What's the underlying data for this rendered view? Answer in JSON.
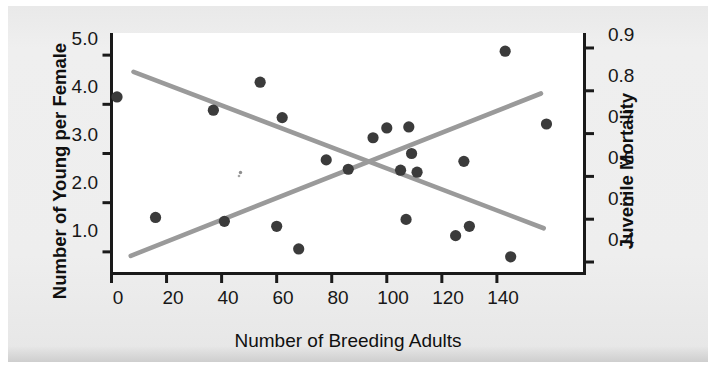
{
  "chart_data": {
    "type": "scatter",
    "title": "",
    "xlabel": "Number of Breeding Adults",
    "ylabel": "Number of Young per Female",
    "y2label": "Juvenile Mortality",
    "xlim": [
      0,
      172
    ],
    "ylim": [
      0.55,
      5.45
    ],
    "y2lim": [
      0.372,
      0.935
    ],
    "grid": false,
    "legend": null,
    "xticks": [
      "0",
      "20",
      "40",
      "60",
      "80",
      "100",
      "120",
      "140"
    ],
    "xtick_values": [
      0,
      20,
      40,
      60,
      80,
      100,
      120,
      140
    ],
    "yticks": [
      "1.0",
      "2.0",
      "3.0",
      "4.0",
      "5.0"
    ],
    "ytick_values": [
      1.0,
      2.0,
      3.0,
      4.0,
      5.0
    ],
    "y2ticks": [
      "0.4",
      "0.5",
      "0.6",
      "0.7",
      "0.8",
      "0.9"
    ],
    "y2tick_values": [
      0.4,
      0.5,
      0.6,
      0.7,
      0.8,
      0.9
    ],
    "marker_color": "#3b3b3b",
    "line_color": "#9a9a9a",
    "axis_color": "#1a1a1a",
    "plot_bg": "#ffffff",
    "page_bg": "#eeeeee",
    "series": [
      {
        "name": "Number of Young per Female",
        "axis": "left",
        "marker": "filled-circle",
        "points": [
          {
            "x": 2,
            "y": 4.15
          },
          {
            "x": 16,
            "y": 1.7
          },
          {
            "x": 37,
            "y": 3.88
          },
          {
            "x": 41,
            "y": 1.62
          },
          {
            "x": 54,
            "y": 4.45
          },
          {
            "x": 60,
            "y": 1.52
          },
          {
            "x": 62,
            "y": 3.73
          },
          {
            "x": 68,
            "y": 1.06
          },
          {
            "x": 78,
            "y": 2.87
          },
          {
            "x": 86,
            "y": 2.68
          },
          {
            "x": 95,
            "y": 3.32
          },
          {
            "x": 100,
            "y": 3.52
          },
          {
            "x": 105,
            "y": 2.66
          },
          {
            "x": 107,
            "y": 1.66
          },
          {
            "x": 108,
            "y": 3.54
          },
          {
            "x": 109,
            "y": 3.0
          },
          {
            "x": 111,
            "y": 2.62
          },
          {
            "x": 125,
            "y": 1.33
          },
          {
            "x": 128,
            "y": 2.84
          },
          {
            "x": 130,
            "y": 1.52
          },
          {
            "x": 143,
            "y": 5.08
          },
          {
            "x": 145,
            "y": 0.9
          },
          {
            "x": 158,
            "y": 3.6
          }
        ]
      }
    ],
    "trendlines": [
      {
        "name": "declining-trend-young-per-female",
        "axis": "left",
        "x1": 8,
        "y1": 4.66,
        "x2": 157,
        "y2": 1.48,
        "color": "#9a9a9a"
      },
      {
        "name": "rising-trend-juvenile-mortality",
        "axis": "left",
        "x1": 7,
        "y1": 0.92,
        "x2": 156,
        "y2": 4.22,
        "color": "#9a9a9a"
      }
    ]
  },
  "chart": {
    "xlabel": "Number of Breeding Adults",
    "ylabel_left": "Number of Young per Female",
    "ylabel_right": "Juvenile Mortality"
  },
  "axes": {
    "x_tick_labels": [
      "0",
      "20",
      "40",
      "60",
      "80",
      "100",
      "120",
      "140"
    ],
    "y_left_tick_labels": [
      "5.0",
      "4.0",
      "3.0",
      "2.0",
      "1.0"
    ],
    "y_right_tick_labels": [
      "0.9",
      "0.8",
      "0.7",
      "0.6",
      "0.5",
      "0.4"
    ]
  }
}
